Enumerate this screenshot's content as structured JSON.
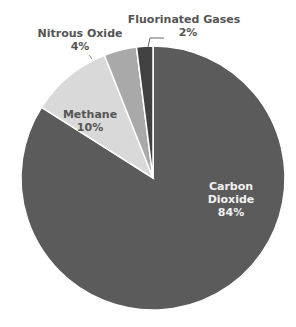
{
  "chart_data": {
    "type": "pie",
    "title": "",
    "categories": [
      "Carbon Dioxide",
      "Methane",
      "Nitrous Oxide",
      "Fluorinated Gases"
    ],
    "values": [
      84,
      10,
      4,
      2
    ],
    "unit": "%",
    "colors": [
      "#5b5b5b",
      "#d9d9d9",
      "#a9a9a9",
      "#414141"
    ],
    "labels": [
      {
        "name_line1": "Carbon",
        "name_line2": "Dioxide",
        "pct": "84%"
      },
      {
        "name": "Methane",
        "pct": "10%"
      },
      {
        "name": "Nitrous Oxide",
        "pct": "4%"
      },
      {
        "name": "Fluorinated Gases",
        "pct": "2%"
      }
    ],
    "legend": "none (direct labels)",
    "start_angle": "12 o'clock, clockwise"
  }
}
